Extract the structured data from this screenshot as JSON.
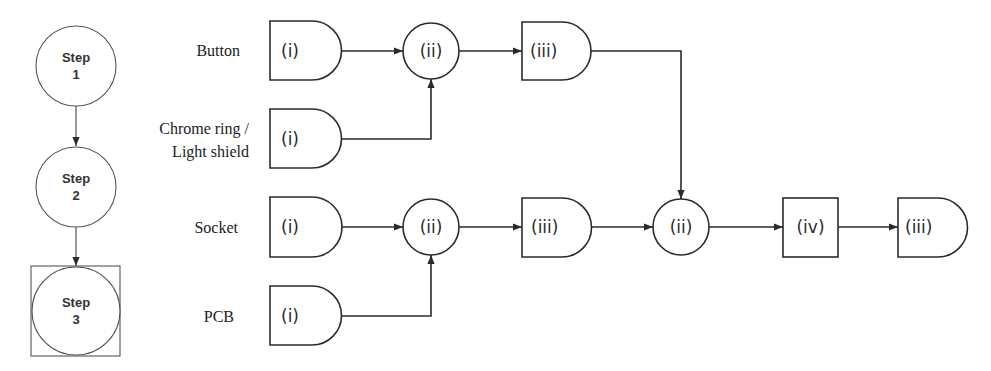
{
  "steps": [
    {
      "line1": "Step",
      "line2": "1"
    },
    {
      "line1": "Step",
      "line2": "2"
    },
    {
      "line1": "Step",
      "line2": "3"
    }
  ],
  "row_labels": {
    "button": "Button",
    "chrome_line1": "Chrome ring /",
    "chrome_line2": "Light shield",
    "socket": "Socket",
    "pcb": "PCB"
  },
  "nodes": {
    "button_i": "(i)",
    "chrome_i": "(i)",
    "socket_i": "(i)",
    "pcb_i": "(i)",
    "top_ii": "(ii)",
    "top_iii": "(iii)",
    "mid_ii": "(ii)",
    "mid_iii": "(iii)",
    "join_ii": "(ii)",
    "final_iv": "(iv)",
    "final_iii": "(iii)"
  },
  "colors": {
    "stroke": "#2b2b2b",
    "background": "#ffffff"
  }
}
